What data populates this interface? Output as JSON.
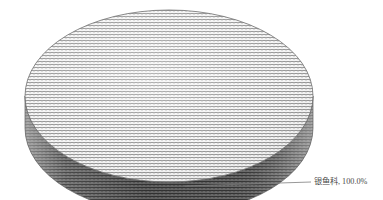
{
  "chart_data": {
    "type": "pie",
    "title": "",
    "subtitle": "",
    "xlabel": "",
    "ylabel": "",
    "three_d": true,
    "grid": false,
    "legend_position": "none",
    "labels_outside": true,
    "categories": [
      "银鱼科"
    ],
    "values": [
      100.0
    ],
    "value_unit": "%",
    "series": [
      {
        "name": "占比",
        "values": [
          100.0
        ]
      }
    ],
    "slices": [
      {
        "name": "银鱼科",
        "value": 100.0,
        "percent_text": "100.0%",
        "label_text": "银鱼科, 100.0%",
        "start_angle": 0,
        "end_angle": 360,
        "fill_pattern": "zigzag-hatch",
        "top_face_color": "#ffffff",
        "top_pattern_color": "#8c8c8c",
        "side_face_color": "#8f8f8f",
        "side_pattern_color": "#333333",
        "outline_color": "#6e6e6e"
      }
    ]
  },
  "chart": {
    "background_color": "#ffffff",
    "label_color": "#4a4a4a",
    "leader_line_color": "#7d7d7d",
    "geometry": {
      "center_x": 169,
      "center_y": 96,
      "radius_x": 144,
      "radius_y": 86,
      "depth": 32
    },
    "data_label": {
      "text": "银鱼科, 100.0%",
      "x": 314,
      "y": 182
    },
    "leader_line": {
      "x1": 185,
      "y1": 186,
      "x2": 311,
      "y2": 182
    }
  }
}
